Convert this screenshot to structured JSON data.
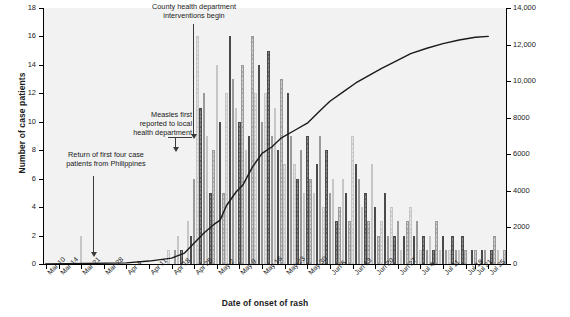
{
  "chart_data": {
    "type": "bar",
    "title": "",
    "xlabel": "Date of onset of rash",
    "ylabel": "Number of case patients",
    "ylabel_right": "Cumulative number of doses of measles-containing vaccine",
    "ylim": [
      0,
      18
    ],
    "yticks": [
      0,
      2,
      4,
      6,
      8,
      10,
      12,
      14,
      16,
      18
    ],
    "ylim_right": [
      0,
      14000
    ],
    "yticks_right": [
      "0",
      "2000",
      "4000",
      "6000",
      "8000",
      "10,000",
      "12,000",
      "14,000"
    ],
    "grid": false,
    "legend": "none",
    "xticks": [
      "Mar 10",
      "Mar 14",
      "Mar 21",
      "Mar 28",
      "Apr 4",
      "Apr 11",
      "Apr 18",
      "Apr 25",
      "May 2",
      "May 9",
      "May 16",
      "May 23",
      "May 30",
      "Jun 6",
      "Jun 13",
      "Jun 20",
      "Jun 27",
      "Jul 4",
      "Jul 11",
      "Jul 18",
      "Jul 21",
      "Jul 25"
    ],
    "series": [
      {
        "name": "Number of case patients by date of onset of rash",
        "type": "bar",
        "x_start": "Mar 10",
        "values": [
          0,
          0,
          0,
          0,
          0,
          0,
          0,
          0,
          0,
          0,
          0,
          2,
          0,
          0,
          0,
          0,
          0,
          0,
          0,
          0,
          0,
          0,
          0,
          0,
          0,
          0,
          0,
          0,
          0,
          0,
          0,
          0,
          0,
          0,
          0,
          0,
          0,
          0,
          1,
          0,
          1,
          2,
          1,
          0,
          3,
          2,
          6,
          16,
          11,
          12,
          9,
          5,
          8,
          14,
          10,
          5,
          12,
          16,
          13,
          11,
          10,
          14,
          8,
          9,
          16,
          12,
          14,
          10,
          12,
          15,
          9,
          11,
          8,
          13,
          7,
          12,
          9,
          7,
          6,
          8,
          5,
          9,
          6,
          5,
          7,
          9,
          4,
          8,
          5,
          6,
          3,
          4,
          6,
          5,
          3,
          9,
          7,
          6,
          4,
          5,
          3,
          7,
          4,
          2,
          3,
          5,
          2,
          4,
          2,
          3,
          1,
          2,
          3,
          4,
          2,
          3,
          1,
          2,
          1,
          2,
          1,
          3,
          1,
          2,
          1,
          1,
          2,
          1,
          1,
          2,
          1,
          0,
          1,
          1,
          0,
          1,
          1,
          0,
          1,
          2,
          1,
          0,
          1
        ]
      },
      {
        "name": "Cumulative number of doses of measles-containing vaccine administered",
        "type": "line",
        "axis": "right",
        "points": [
          {
            "date": "Mar 10",
            "value": 0
          },
          {
            "date": "Apr 4",
            "value": 60
          },
          {
            "date": "Apr 11",
            "value": 160
          },
          {
            "date": "Apr 18",
            "value": 320
          },
          {
            "date": "Apr 22",
            "value": 600
          },
          {
            "date": "Apr 25",
            "value": 1150
          },
          {
            "date": "Apr 28",
            "value": 1700
          },
          {
            "date": "May 1",
            "value": 2150
          },
          {
            "date": "May 3",
            "value": 2400
          },
          {
            "date": "May 5",
            "value": 3200
          },
          {
            "date": "May 8",
            "value": 3950
          },
          {
            "date": "May 10",
            "value": 4300
          },
          {
            "date": "May 13",
            "value": 5300
          },
          {
            "date": "May 16",
            "value": 6050
          },
          {
            "date": "May 19",
            "value": 6400
          },
          {
            "date": "May 22",
            "value": 6900
          },
          {
            "date": "May 26",
            "value": 7300
          },
          {
            "date": "May 30",
            "value": 7700
          },
          {
            "date": "Jun 3",
            "value": 8400
          },
          {
            "date": "Jun 6",
            "value": 8900
          },
          {
            "date": "Jun 10",
            "value": 9400
          },
          {
            "date": "Jun 14",
            "value": 9900
          },
          {
            "date": "Jun 18",
            "value": 10300
          },
          {
            "date": "Jun 22",
            "value": 10700
          },
          {
            "date": "Jun 26",
            "value": 11050
          },
          {
            "date": "Jul 1",
            "value": 11500
          },
          {
            "date": "Jul 6",
            "value": 11800
          },
          {
            "date": "Jul 11",
            "value": 12050
          },
          {
            "date": "Jul 16",
            "value": 12250
          },
          {
            "date": "Jul 21",
            "value": 12400
          },
          {
            "date": "Jul 25",
            "value": 12450
          }
        ]
      }
    ],
    "annotations": [
      {
        "id": "county",
        "text": "County health department\ninterventions begin",
        "target_date": "Apr 25"
      },
      {
        "id": "measles",
        "text": "Measles first\nreported to local\nhealth department",
        "target_date": "Apr 20"
      },
      {
        "id": "return",
        "text": "Return of first four case\npatients from Philippines",
        "target_date": "Mar 21"
      }
    ]
  },
  "axes": {
    "left_title": "Number of case patients",
    "right_title": "Cumulative number of doses of measles-containing vaccine",
    "bottom_title": "Date of onset of rash"
  },
  "annotations": {
    "county_line1": "County health department",
    "county_line2": "interventions begin",
    "measles_line1": "Measles first",
    "measles_line2": "reported to local",
    "measles_line3": "health department",
    "return_line1": "Return of first four case",
    "return_line2": "patients from Philippines"
  },
  "colors": {
    "bar_dark": "#8a8a8a",
    "bar_light": "#cfcfcf",
    "bar_pale": "#e6e6e6",
    "line": "#1a1a1a",
    "plot_background": "#f2f2f2"
  }
}
